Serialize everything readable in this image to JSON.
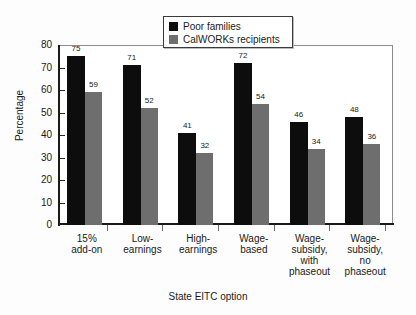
{
  "chart_data": {
    "type": "bar",
    "title": "",
    "xlabel": "State EITC option",
    "ylabel": "Percentage",
    "ylim": [
      0,
      80
    ],
    "yticks": [
      0,
      10,
      20,
      30,
      40,
      50,
      60,
      70,
      80
    ],
    "ytick_labels": [
      "0",
      "10",
      "20",
      "30",
      "40",
      "50",
      "60",
      "70",
      "80"
    ],
    "grid": false,
    "legend_position": "top-center",
    "categories": [
      "15%\nadd-on",
      "Low-\nearnings",
      "High-\nearnings",
      "Wage-\nbased",
      "Wage-\nsubsidy,\nwith\nphaseout",
      "Wage-\nsubsidy,\nno\nphaseout"
    ],
    "series": [
      {
        "name": "Poor families",
        "color": "#0d0d0d",
        "values": [
          75,
          71,
          41,
          72,
          46,
          48
        ]
      },
      {
        "name": "CalWORKs recipients",
        "color": "#6e6e6e",
        "values": [
          59,
          52,
          32,
          54,
          34,
          36
        ]
      }
    ]
  },
  "legend": {
    "items": [
      {
        "label": "Poor families",
        "color": "#0d0d0d"
      },
      {
        "label": "CalWORKs recipients",
        "color": "#6e6e6e"
      }
    ]
  }
}
